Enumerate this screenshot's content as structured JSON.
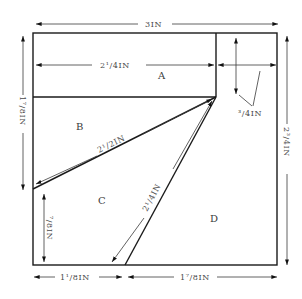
{
  "diagram": {
    "regions": [
      {
        "id": "A",
        "label": "A"
      },
      {
        "id": "B",
        "label": "B"
      },
      {
        "id": "C",
        "label": "C"
      },
      {
        "id": "D",
        "label": "D"
      }
    ],
    "dimensions": {
      "top_width": {
        "whole": "3",
        "frac": "",
        "unit": "IN"
      },
      "region_a_width": {
        "whole": "2",
        "num": "1",
        "den": "4",
        "unit": "IN"
      },
      "small_square": {
        "whole": "",
        "num": "3",
        "den": "4",
        "unit": "IN"
      },
      "left_height": {
        "whole": "1",
        "num": "7",
        "den": "8",
        "unit": "IN"
      },
      "right_height": {
        "whole": "2",
        "num": "3",
        "den": "4",
        "unit": "IN"
      },
      "diagonal_long": {
        "whole": "2",
        "num": "1",
        "den": "2",
        "unit": "IN"
      },
      "diagonal_steep": {
        "whole": "2",
        "num": "1",
        "den": "4",
        "unit": "IN"
      },
      "left_lower_height": {
        "whole": "",
        "num": "7",
        "den": "8",
        "unit": "IN"
      },
      "bottom_left": {
        "whole": "1",
        "num": "1",
        "den": "8",
        "unit": "IN"
      },
      "bottom_right": {
        "whole": "1",
        "num": "7",
        "den": "8",
        "unit": "IN"
      }
    },
    "labels": {
      "top_width": "3IN",
      "region_a_width": "2¹/4IN",
      "small_square": "³/4IN",
      "left_height": "1⁷/8IN",
      "right_height": "2³/4IN",
      "diagonal_long": "2¹/2IN",
      "diagonal_steep": "2¹/4IN",
      "left_lower_height": "⁷/8IN",
      "bottom_left": "1¹/8IN",
      "bottom_right": "1⁷/8IN"
    },
    "colors": {
      "line": "#1a1a1a",
      "dimension_line": "#3a3a3a",
      "text": "#4a4a4a",
      "background": "#ffffff"
    }
  }
}
